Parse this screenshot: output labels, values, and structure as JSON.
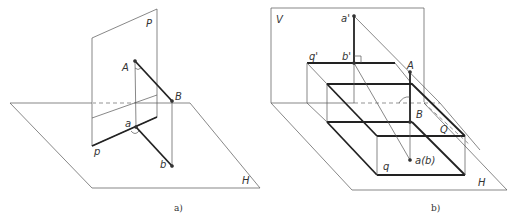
{
  "figure_a": {
    "caption": "a)",
    "labels": {
      "plane_P": "P",
      "plane_H": "H",
      "point_A": "A",
      "point_B": "B",
      "point_a": "a",
      "point_b": "b",
      "trace_p": "p"
    }
  },
  "figure_b": {
    "caption": "b)",
    "labels": {
      "plane_V": "V",
      "plane_H": "H",
      "point_a_prime": "a'",
      "point_b_prime": "b'",
      "trace_q_prime": "q'",
      "point_A": "A",
      "point_B": "B",
      "plane_Q": "Q",
      "trace_q": "q",
      "point_ab": "a(b)"
    }
  }
}
